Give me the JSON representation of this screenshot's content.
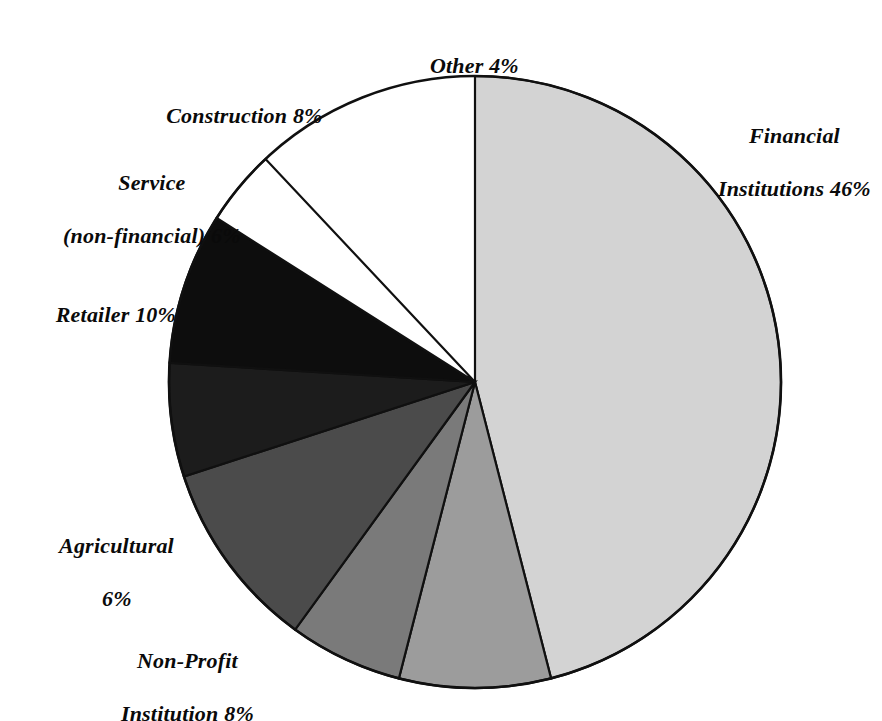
{
  "chart_data": {
    "type": "pie",
    "title": "",
    "subtitle": "",
    "xlabel": "",
    "ylabel": "",
    "legend_position": "none",
    "grid": false,
    "units": "percent",
    "total": 88,
    "categories": [
      "Financial Institutions",
      "Non-Profit Institution",
      "Agricultural",
      "Retailer",
      "Service (non-financial)",
      "Construction",
      "Other"
    ],
    "values": [
      46,
      8,
      6,
      10,
      6,
      8,
      4
    ],
    "slices": [
      {
        "name": "Financial Institutions",
        "value": 46,
        "value_text": "46%",
        "label_lines": [
          "Financial",
          "Institutions 46%"
        ],
        "color": "#d3d3d3",
        "start_angle": 0,
        "end_angle": 165.6,
        "label_position": "right"
      },
      {
        "name": "Non-Profit Institution",
        "value": 8,
        "value_text": "8%",
        "label_lines": [
          "Non-Profit",
          "Institution 8%"
        ],
        "color": "#9c9c9c",
        "start_angle": 165.6,
        "end_angle": 194.4,
        "label_position": "bottom-left"
      },
      {
        "name": "Agricultural",
        "value": 6,
        "value_text": "6%",
        "label_lines": [
          "Agricultural",
          "6%"
        ],
        "color": "#7a7a7a",
        "start_angle": 194.4,
        "end_angle": 216.0,
        "label_position": "left-lower"
      },
      {
        "name": "Retailer",
        "value": 10,
        "value_text": "10%",
        "label_lines": [
          "Retailer 10%"
        ],
        "color": "#4b4b4b",
        "start_angle": 216.0,
        "end_angle": 252.0,
        "label_position": "left"
      },
      {
        "name": "Service (non-financial)",
        "value": 6,
        "value_text": "6%",
        "label_lines": [
          "Service",
          "(non-financial) 6%"
        ],
        "color": "#1c1c1c",
        "start_angle": 252.0,
        "end_angle": 273.6,
        "label_position": "upper-left"
      },
      {
        "name": "Construction",
        "value": 8,
        "value_text": "8%",
        "label_lines": [
          "Construction 8%"
        ],
        "color": "#0d0d0d",
        "start_angle": 273.6,
        "end_angle": 302.4,
        "label_position": "top-left"
      },
      {
        "name": "Other",
        "value": 4,
        "value_text": "4%",
        "label_lines": [
          "Other 4%"
        ],
        "color": "#ffffff",
        "start_angle": 302.4,
        "end_angle": 316.8,
        "label_position": "top"
      }
    ],
    "geometry": {
      "center_x": 475,
      "center_y": 382,
      "radius": 306,
      "start_at_twelve_oclock": true,
      "direction": "clockwise"
    },
    "outline_color": "#101010",
    "background_color": "#ffffff"
  },
  "labels": {
    "other": "Other 4%",
    "construction": "Construction 8%",
    "service_line1": "Service",
    "service_line2": "(non-financial) 6%",
    "retailer": "Retailer 10%",
    "agricultural_line1": "Agricultural",
    "agricultural_line2": "6%",
    "nonprofit_line1": "Non-Profit",
    "nonprofit_line2": "Institution 8%",
    "financial_line1": "Financial",
    "financial_line2": "Institutions 46%"
  }
}
